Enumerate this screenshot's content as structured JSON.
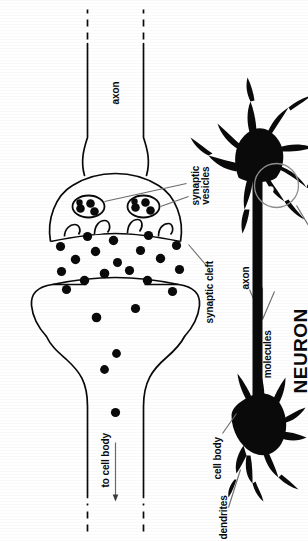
{
  "figure": {
    "title_label": "NEURON",
    "labels": {
      "to_cell_body": "to cell body",
      "neurotransmitter": "neurotransmitter",
      "molecules": "molecules",
      "synaptic": "synaptic",
      "vesicles": "vesicles",
      "synaptic_cleft": "synaptic cleft",
      "axon_synapse": "axon",
      "axon_neuron": "axon",
      "cell_body": "cell body",
      "dendrites": "dendrites"
    },
    "colors": {
      "ink": "#0a0a0a",
      "paper": "#ffffff",
      "leader": "#6b6b6b"
    },
    "icons": {
      "arrow": "arrow-up-icon",
      "highlight": "synapse-highlight-circle-icon"
    },
    "counts": {
      "neurotransmitter_dots": 22,
      "vesicle_clusters": 2,
      "receptor_pockets": 4
    }
  }
}
